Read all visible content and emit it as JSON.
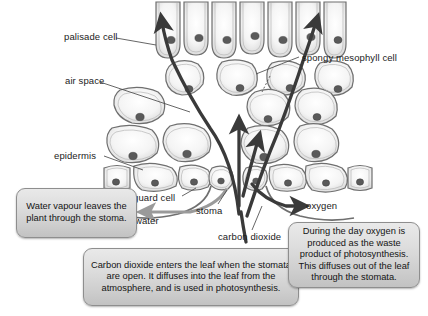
{
  "figure": {
    "type": "biology-diagram",
    "background_color": "#ffffff"
  },
  "labels": [
    {
      "id": "palisade-cell",
      "text": "palisade cell"
    },
    {
      "id": "air-space",
      "text": "air space"
    },
    {
      "id": "epidermis",
      "text": "epidermis"
    },
    {
      "id": "guard-cell",
      "text": "guard cell"
    },
    {
      "id": "water",
      "text": "water"
    },
    {
      "id": "stoma",
      "text": "stoma"
    },
    {
      "id": "carbon-dioxide",
      "text": "carbon dioxide"
    },
    {
      "id": "oxygen",
      "text": "oxygen"
    },
    {
      "id": "spongy-mesophyll-cell",
      "text": "spongy mesophyll cell"
    }
  ],
  "callouts": [
    {
      "id": "water-vapour-callout",
      "text": "Water vapour leaves the plant through the stoma."
    },
    {
      "id": "carbon-dioxide-callout",
      "text": "Carbon dioxide enters the leaf when the stomata are open. It diffuses into the leaf from the atmosphere, and is used in photosynthesis."
    },
    {
      "id": "oxygen-callout",
      "text": "During the day oxygen is produced as the waste product of photosynthesis. This diffuses out of the leaf through the stomata."
    }
  ],
  "colors": {
    "arrow_dark": "#3a3a3a",
    "arrow_gray": "#9a9a9a",
    "cell_wall": "#6f6f6f",
    "cell_fill": "#ffffff",
    "nucleus": "#555555",
    "callout_border": "#8e8e8e",
    "callout_fill": "#dcdcdc",
    "leader_line": "#4a4a4a",
    "text": "#1b1b1b"
  }
}
